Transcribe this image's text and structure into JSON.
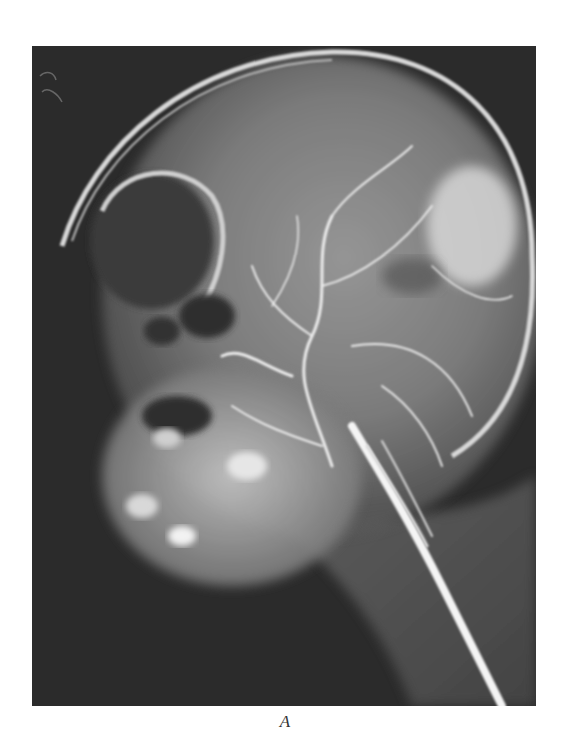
{
  "figure": {
    "image_type": "radiograph",
    "caption_label": "A",
    "colors": {
      "background": "#ffffff",
      "film_dark": "#2a2a2a",
      "bone_bright": "#e8e8e8",
      "caption_text": "#333333"
    }
  }
}
